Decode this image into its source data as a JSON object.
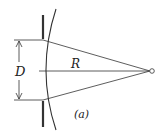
{
  "diagram": {
    "labels": {
      "diameter": "D",
      "radius": "R",
      "caption": "(a)"
    },
    "colors": {
      "line": "#333333",
      "background": "#ffffff"
    }
  }
}
